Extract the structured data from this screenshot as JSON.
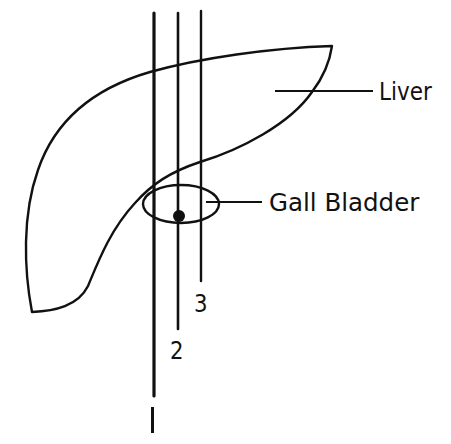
{
  "diagram": {
    "type": "anatomical-sketch",
    "stroke_color": "#111111",
    "background": "#ffffff",
    "labels": {
      "liver": "Liver",
      "gall_bladder": "Gall Bladder"
    },
    "lines": [
      {
        "id": "1",
        "label": "1"
      },
      {
        "id": "2",
        "label": "2"
      },
      {
        "id": "3",
        "label": "3"
      }
    ]
  }
}
